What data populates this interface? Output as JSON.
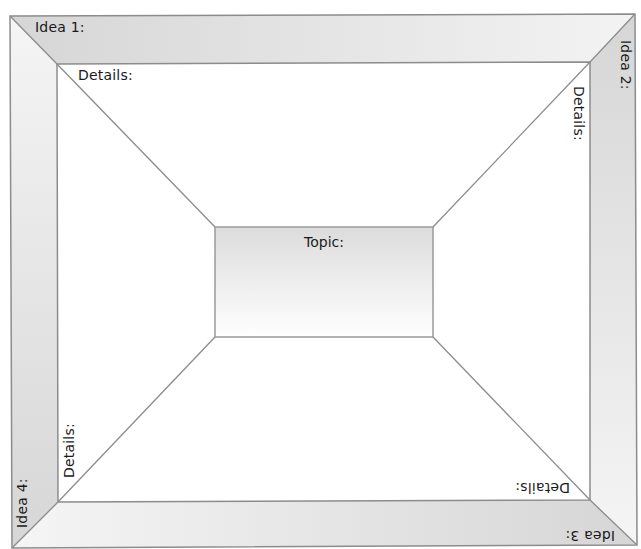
{
  "organizer": {
    "title": "Four Idea Graphic Organizer",
    "topic": {
      "label": "Topic:"
    },
    "ideas": [
      {
        "id": 1,
        "label": "Idea 1:",
        "details_label": "Details:",
        "position": "top"
      },
      {
        "id": 2,
        "label": "Idea 2:",
        "details_label": "Details:",
        "position": "right"
      },
      {
        "id": 3,
        "label": "Idea 3:",
        "details_label": "Details:",
        "position": "bottom"
      },
      {
        "id": 4,
        "label": "Idea 4:",
        "details_label": "Details:",
        "position": "left"
      }
    ],
    "colors": {
      "band_fill_dark": "#d9d9d9",
      "band_fill_light": "#f4f4f4",
      "line": "#8c8c8c",
      "text": "#1a1a1a"
    }
  }
}
